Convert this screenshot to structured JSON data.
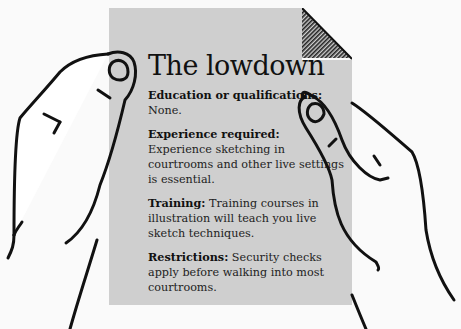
{
  "card": {
    "title": "The lowdown",
    "sections": [
      {
        "heading": "Education or qualifications:",
        "body": "None."
      },
      {
        "heading": "Experience required:",
        "body": "Experience sketching in courtrooms and other live settings is essential."
      },
      {
        "heading": "Training:",
        "body": "Training courses in illustration will teach you live sketch techniques."
      },
      {
        "heading": "Restrictions:",
        "body": "Security checks apply before walking into most courtrooms."
      }
    ]
  },
  "colors": {
    "paper": "#cfcfcf",
    "background": "#fafafa",
    "ink": "#111111"
  },
  "icons": [
    "left-hand-icon",
    "right-hand-icon",
    "folded-corner-icon"
  ]
}
